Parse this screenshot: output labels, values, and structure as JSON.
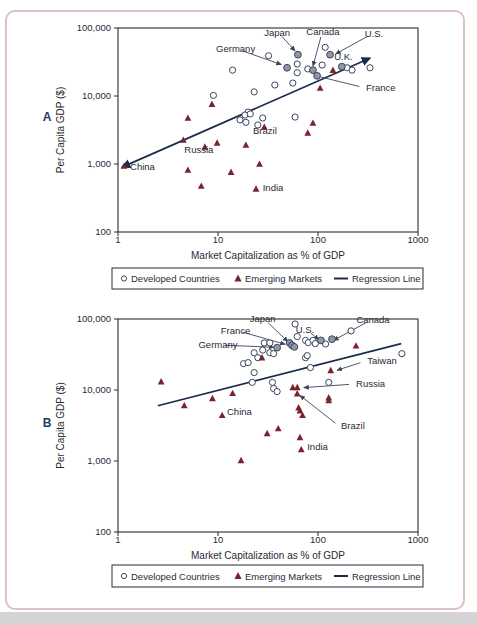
{
  "figure": {
    "border_color": "#dcc2c2",
    "bottom_strip_color": "#d4d4d4",
    "background": "#ffffff",
    "text_color": "#2a2a33",
    "panel_letter_color": "#1c3a6a"
  },
  "legend": {
    "items": [
      {
        "label": "Developed Countries",
        "marker": "circle-open"
      },
      {
        "label": "Emerging Markets",
        "marker": "triangle-filled"
      },
      {
        "label": "Regression Line",
        "marker": "line"
      }
    ]
  },
  "chart_data": [
    {
      "type": "scatter",
      "panel_label": "A",
      "x_axis": {
        "label": "Market Capitalization as % of GDP",
        "scale": "log",
        "min": 1,
        "max": 1000,
        "ticks": [
          "1",
          "10",
          "100",
          "1000"
        ]
      },
      "y_axis": {
        "label": "Per Capita GDP ($)",
        "scale": "log",
        "min": 100,
        "max": 100000,
        "ticks": [
          "100",
          "1,000",
          "10,000",
          "100,000"
        ]
      },
      "colors": {
        "developed_stroke": "#3a4560",
        "developed_fill": "#ffffff",
        "highlight_fill": "#9098a5",
        "emerging_fill": "#7a2330",
        "line": "#1c2b4d"
      },
      "series": [
        {
          "name": "Developed Countries",
          "marker": "circle-open",
          "points": [
            [
              32,
              39000
            ],
            [
              14,
              24000
            ],
            [
              62,
              29500
            ],
            [
              62,
              22000
            ],
            [
              79,
              25000
            ],
            [
              110,
              28500
            ],
            [
              118,
              52000
            ],
            [
              195,
              26000
            ],
            [
              219,
              24000
            ],
            [
              331,
              26000
            ],
            [
              37,
              14500
            ],
            [
              56,
              15500
            ],
            [
              23,
              11500
            ],
            [
              9,
              10200
            ],
            [
              20,
              5800
            ],
            [
              16.6,
              4450
            ],
            [
              19,
              4100
            ],
            [
              18.6,
              5250
            ],
            [
              21,
              5450
            ],
            [
              25,
              3750
            ],
            [
              59,
              4900
            ],
            [
              28,
              4750
            ]
          ]
        },
        {
          "name": "Developed Countries (labeled)",
          "marker": "circle-filled",
          "points": [
            [
              63,
              40500
            ],
            [
              49,
              26000
            ],
            [
              89,
              24000
            ],
            [
              132,
              40500
            ],
            [
              173,
              27000
            ],
            [
              98,
              19800
            ]
          ]
        },
        {
          "name": "Emerging Markets",
          "marker": "triangle-filled",
          "points": [
            [
              8.7,
              7600
            ],
            [
              5,
              4750
            ],
            [
              4.5,
              2250
            ],
            [
              7.4,
              1780
            ],
            [
              9.8,
              2040
            ],
            [
              19,
              1900
            ],
            [
              1.15,
              935
            ],
            [
              5,
              815
            ],
            [
              13.5,
              760
            ],
            [
              26,
              1000
            ],
            [
              6.8,
              475
            ],
            [
              24,
              430
            ],
            [
              29,
              3500
            ],
            [
              79,
              2870
            ],
            [
              89,
              4000
            ],
            [
              105,
              13100
            ],
            [
              141,
              24000
            ]
          ]
        }
      ],
      "regression_line": {
        "from": [
          1.1,
          900
        ],
        "to": [
          330,
          36000
        ],
        "arrows": true
      },
      "annotations": [
        {
          "text": "Japan",
          "label": [
            39,
            76000
          ],
          "anchor": "middle",
          "target": [
            59,
            46000
          ],
          "arrow": true
        },
        {
          "text": "Canada",
          "label": [
            112,
            79000
          ],
          "anchor": "middle",
          "target": [
            89,
            27500
          ],
          "arrow": true
        },
        {
          "text": "U.S.",
          "label": [
            363,
            74000
          ],
          "anchor": "middle",
          "target": [
            150,
            41500
          ],
          "arrow": true
        },
        {
          "text": "Germany",
          "label": [
            15,
            44000
          ],
          "anchor": "middle",
          "target": [
            43,
            29000
          ],
          "arrow": true
        },
        {
          "text": "U.K.",
          "label": [
            145,
            34000
          ],
          "anchor": "start",
          "target": null,
          "arrow": false
        },
        {
          "text": "France",
          "label": [
            302,
            12000
          ],
          "anchor": "start",
          "target": [
            107,
            19000
          ],
          "arrow": false
        },
        {
          "text": "Brazil",
          "label": [
            22.4,
            2800
          ],
          "anchor": "start",
          "target": null,
          "arrow": false
        },
        {
          "text": "Russia",
          "label": [
            4.6,
            1450
          ],
          "anchor": "start",
          "target": null,
          "arrow": false
        },
        {
          "text": "China",
          "label": [
            1.32,
            815
          ],
          "anchor": "start",
          "target": null,
          "arrow": false
        },
        {
          "text": "India",
          "label": [
            28,
            400
          ],
          "anchor": "start",
          "target": null,
          "arrow": false
        }
      ]
    },
    {
      "type": "scatter",
      "panel_label": "B",
      "x_axis": {
        "label": "Market Capitalization as % of GDP",
        "scale": "log",
        "min": 1,
        "max": 1000,
        "ticks": [
          "1",
          "10",
          "100",
          "1000"
        ]
      },
      "y_axis": {
        "label": "Per Capita GDP ($)",
        "scale": "log",
        "min": 100,
        "max": 100000,
        "ticks": [
          "100",
          "1,000",
          "10,000",
          "100,000"
        ]
      },
      "colors": {
        "developed_stroke": "#3a4560",
        "developed_fill": "#ffffff",
        "highlight_fill": "#9098a5",
        "emerging_fill": "#7a2330",
        "line": "#1c2b4d"
      },
      "series": [
        {
          "name": "Developed Countries",
          "marker": "circle-open",
          "points": [
            [
              59,
              85000
            ],
            [
              29,
              46000
            ],
            [
              33,
              46000
            ],
            [
              62,
              56500
            ],
            [
              75,
              50000
            ],
            [
              80,
              46500
            ],
            [
              89,
              50000
            ],
            [
              94,
              45000
            ],
            [
              119,
              44500
            ],
            [
              214,
              68000
            ],
            [
              690,
              32500
            ],
            [
              28,
              36500
            ],
            [
              33,
              33500
            ],
            [
              36,
              32500
            ],
            [
              23,
              33500
            ],
            [
              25,
              28500
            ],
            [
              18,
              23500
            ],
            [
              20,
              24300
            ],
            [
              23,
              17600
            ],
            [
              22,
              12800
            ],
            [
              35,
              12800
            ],
            [
              36,
              10500
            ],
            [
              39,
              9500
            ],
            [
              75,
              28500
            ],
            [
              84,
              20700
            ],
            [
              128,
              12800
            ],
            [
              78,
              30500
            ]
          ]
        },
        {
          "name": "Developed Countries (labeled)",
          "marker": "circle-filled",
          "points": [
            [
              52,
              46000
            ],
            [
              55,
              42500
            ],
            [
              39,
              39500
            ],
            [
              58,
              40500
            ],
            [
              107,
              50000
            ],
            [
              138,
              52000
            ]
          ]
        },
        {
          "name": "Emerging Markets",
          "marker": "triangle-filled",
          "points": [
            [
              2.7,
              13100
            ],
            [
              4.6,
              6050
            ],
            [
              8.8,
              7600
            ],
            [
              14,
              9000
            ],
            [
              11,
              4400
            ],
            [
              27.5,
              28500
            ],
            [
              240,
              42000
            ],
            [
              134,
              18900
            ],
            [
              56,
              10900
            ],
            [
              62,
              10900
            ],
            [
              62,
              8900
            ],
            [
              64,
              5650
            ],
            [
              66,
              5100
            ],
            [
              70,
              4400
            ],
            [
              128,
              7800
            ],
            [
              128,
              7100
            ],
            [
              40,
              2870
            ],
            [
              31,
              2450
            ],
            [
              66,
              2150
            ],
            [
              68,
              1450
            ],
            [
              17,
              1020
            ]
          ]
        }
      ],
      "regression_line": {
        "from": [
          2.5,
          6000
        ],
        "to": [
          680,
          45000
        ],
        "arrows": false
      },
      "annotations": [
        {
          "text": "Japan",
          "label": [
            28,
            90000
          ],
          "anchor": "middle",
          "target": [
            50,
            48000
          ],
          "arrow": true
        },
        {
          "text": "France",
          "label": [
            15,
            62000
          ],
          "anchor": "middle",
          "target": [
            47,
            44000
          ],
          "arrow": true
        },
        {
          "text": "Germany",
          "label": [
            10,
            39000
          ],
          "anchor": "middle",
          "target": [
            36,
            40000
          ],
          "arrow": true
        },
        {
          "text": "U.S.",
          "label": [
            74,
            63000
          ],
          "anchor": "middle",
          "target": [
            102,
            51000
          ],
          "arrow": true
        },
        {
          "text": "Canada",
          "label": [
            355,
            88000
          ],
          "anchor": "middle",
          "target": [
            143,
            50000
          ],
          "arrow": true
        },
        {
          "text": "Taiwan",
          "label": [
            310,
            23000
          ],
          "anchor": "start",
          "target": [
            155,
            19000
          ],
          "arrow": true
        },
        {
          "text": "Russia",
          "label": [
            240,
            11000
          ],
          "anchor": "start",
          "target": [
            72,
            10800
          ],
          "arrow": true
        },
        {
          "text": "Brazil",
          "label": [
            170,
            2800
          ],
          "anchor": "start",
          "target": [
            66,
            8400
          ],
          "arrow": true
        },
        {
          "text": "China",
          "label": [
            12.3,
            4450
          ],
          "anchor": "start",
          "target": null,
          "arrow": false
        },
        {
          "text": "India",
          "label": [
            78,
            1430
          ],
          "anchor": "start",
          "target": null,
          "arrow": false
        }
      ]
    }
  ]
}
